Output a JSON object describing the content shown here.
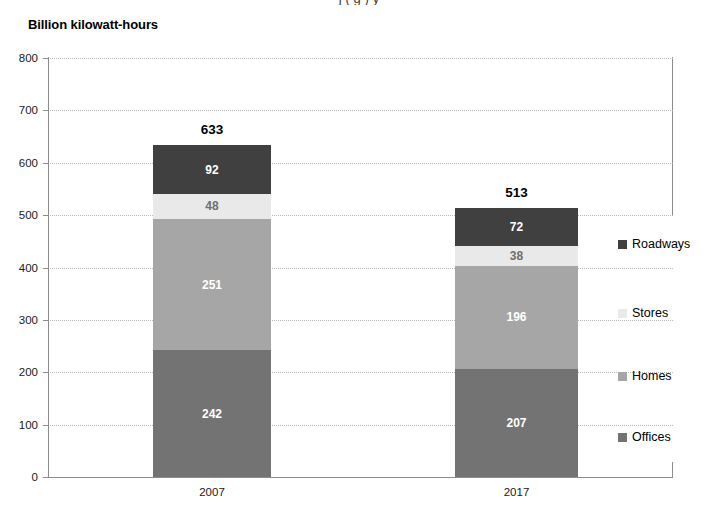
{
  "title_fragment": "j         ( g )                                       y",
  "axis_unit_title": "Billion kilowatt-hours",
  "chart_data": {
    "type": "bar",
    "subtype": "stacked-column",
    "title": "Billion kilowatt-hours",
    "xlabel": "",
    "ylabel": "Billion kilowatt-hours",
    "ylim": [
      0,
      800
    ],
    "ytick_step": 100,
    "yticks": [
      "800",
      "700",
      "600",
      "500",
      "400",
      "300",
      "200",
      "100",
      "0"
    ],
    "ytick_values": [
      800,
      700,
      600,
      500,
      400,
      300,
      200,
      100,
      0
    ],
    "grid": true,
    "grid_style": "dotted-horizontal",
    "legend_position": "right",
    "categories": [
      "2007",
      "2017"
    ],
    "stack_order_bottom_to_top": [
      "Offices",
      "Homes",
      "Stores",
      "Roadways"
    ],
    "series": [
      {
        "name": "Offices",
        "values": [
          242,
          207
        ],
        "color": "#737373"
      },
      {
        "name": "Homes",
        "values": [
          251,
          196
        ],
        "color": "#a6a6a6"
      },
      {
        "name": "Stores",
        "values": [
          48,
          38
        ],
        "color": "#e9e9e9"
      },
      {
        "name": "Roadways",
        "values": [
          92,
          72
        ],
        "color": "#404040"
      }
    ],
    "totals": [
      633,
      513
    ],
    "total_labels": [
      "633",
      "513"
    ],
    "legend_entries": [
      {
        "label": "Roadways",
        "color": "#404040"
      },
      {
        "label": "Stores",
        "color": "#e9e9e9"
      },
      {
        "label": "Homes",
        "color": "#a6a6a6"
      },
      {
        "label": "Offices",
        "color": "#737373"
      }
    ],
    "bars": [
      {
        "category": "2007",
        "total": 633,
        "total_label": "633",
        "segments": [
          {
            "name": "Roadways",
            "value": 92,
            "label": "92",
            "color": "#404040",
            "text_color": "#ffffff"
          },
          {
            "name": "Stores",
            "value": 48,
            "label": "48",
            "color": "#e9e9e9",
            "text_color": "#6e6e6e"
          },
          {
            "name": "Homes",
            "value": 251,
            "label": "251",
            "color": "#a6a6a6",
            "text_color": "#ffffff"
          },
          {
            "name": "Offices",
            "value": 242,
            "label": "242",
            "color": "#737373",
            "text_color": "#ffffff"
          }
        ]
      },
      {
        "category": "2017",
        "total": 513,
        "total_label": "513",
        "segments": [
          {
            "name": "Roadways",
            "value": 72,
            "label": "72",
            "color": "#404040",
            "text_color": "#ffffff"
          },
          {
            "name": "Stores",
            "value": 38,
            "label": "38",
            "color": "#e9e9e9",
            "text_color": "#6e6e6e"
          },
          {
            "name": "Homes",
            "value": 196,
            "label": "196",
            "color": "#a6a6a6",
            "text_color": "#ffffff"
          },
          {
            "name": "Offices",
            "value": 207,
            "label": "207",
            "color": "#737373",
            "text_color": "#ffffff"
          }
        ]
      }
    ]
  },
  "colors": {
    "axis": "#8c8c8c",
    "grid": "#b9b9b9",
    "background": "#ffffff",
    "text": "#000000"
  }
}
